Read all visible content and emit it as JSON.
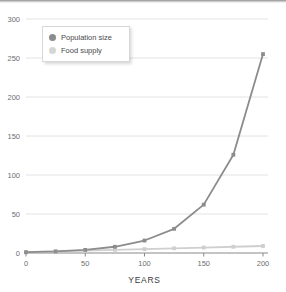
{
  "chart_data": {
    "type": "line",
    "title": "",
    "xlabel": "YEARS",
    "ylabel": "",
    "xlim": [
      0,
      200
    ],
    "ylim": [
      0,
      300
    ],
    "x": [
      0,
      25,
      50,
      75,
      100,
      125,
      150,
      175,
      200
    ],
    "xticks": [
      "0",
      "50",
      "100",
      "150",
      "200"
    ],
    "yticks": [
      "0",
      "50",
      "100",
      "150",
      "200",
      "250",
      "300"
    ],
    "grid": "horizontal",
    "legend_position": "upper-left-inside",
    "series": [
      {
        "name": "Population size",
        "color": "#8c8c8c",
        "marker": "square",
        "values": [
          1,
          2,
          4,
          8,
          16,
          31,
          62,
          126,
          255
        ]
      },
      {
        "name": "Food supply",
        "color": "#cfcfcf",
        "marker": "square",
        "values": [
          1,
          2,
          3,
          4,
          5,
          6,
          7,
          8,
          9
        ]
      }
    ]
  },
  "legend": {
    "items": [
      {
        "label": "Population size",
        "color": "#8c8c8c"
      },
      {
        "label": "Food supply",
        "color": "#d6d6d6"
      }
    ]
  },
  "axis": {
    "x_title": "YEARS"
  },
  "colors": {
    "gridline": "#e2e2e2",
    "axis": "#8a8a8a",
    "tick_text": "#6e6e6e",
    "population": "#8c8c8c",
    "food": "#cfcfcf",
    "background": "#ffffff"
  }
}
